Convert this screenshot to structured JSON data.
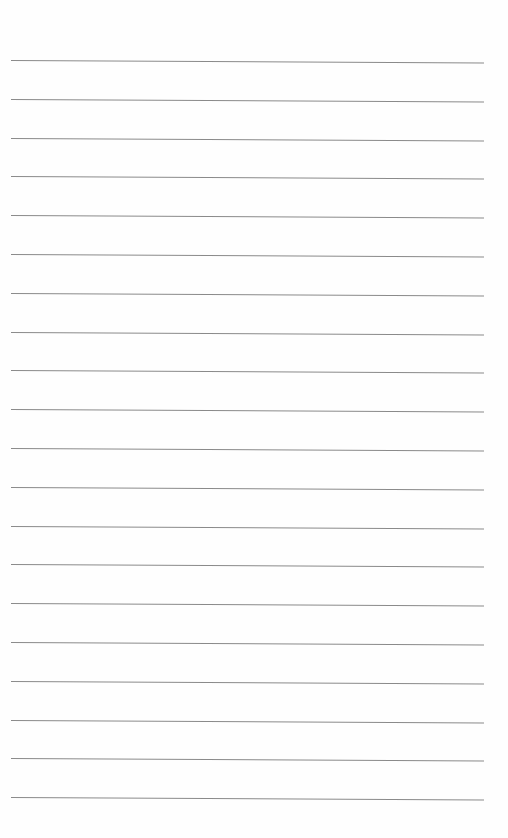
{
  "page": {
    "type": "blank ruled sheet",
    "background_color": "#fefefe",
    "line_color": "#8a8a8a",
    "line_count": 20,
    "first_line_y": 60,
    "line_spacing": 38.8,
    "line_left": 11,
    "line_width": 473
  }
}
